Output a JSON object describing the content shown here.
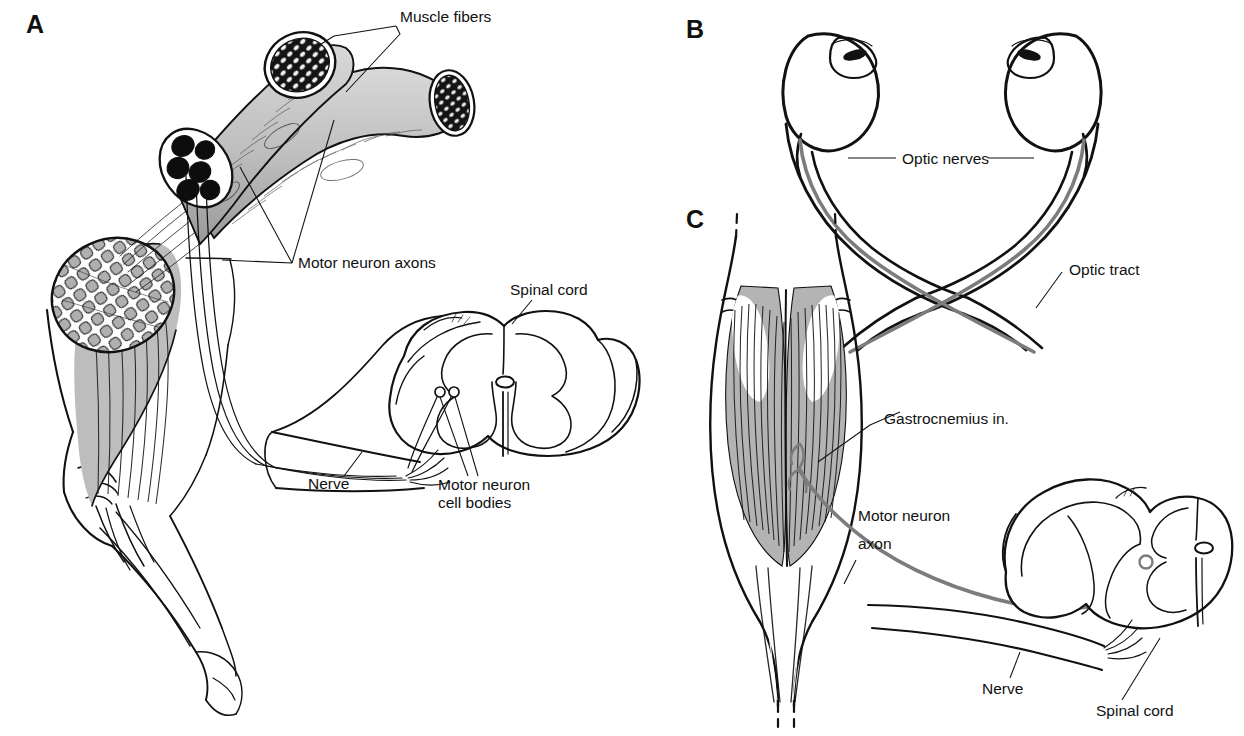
{
  "figure": {
    "background_color": "#ffffff",
    "ink_color": "#111111",
    "nerve_color": "#7c7c7c",
    "muscle_fill_color": "#b4b4b4"
  },
  "panels": [
    {
      "id": "A",
      "letter": "A",
      "subject": "Flexed human arm with biceps muscle, nerve bundle cross-sections, and spinal cord cross-section",
      "labels": [
        {
          "key": "muscle_fibers",
          "text": "Muscle fibers"
        },
        {
          "key": "motor_neuron_axons",
          "text": "Motor neuron axons"
        },
        {
          "key": "spinal_cord",
          "text": "Spinal cord"
        },
        {
          "key": "nerve",
          "text": "Nerve"
        },
        {
          "key": "motor_neuron_cell_bodies_line1",
          "text": "Motor neuron"
        },
        {
          "key": "motor_neuron_cell_bodies_line2",
          "text": "cell bodies"
        }
      ]
    },
    {
      "id": "B",
      "letter": "B",
      "subject": "Pair of eyeballs with optic nerves crossing at the optic chiasm into the optic tracts",
      "labels": [
        {
          "key": "optic_nerves",
          "text": "Optic nerves"
        },
        {
          "key": "optic_tract",
          "text": "Optic tract"
        }
      ]
    },
    {
      "id": "C",
      "letter": "C",
      "subject": "Gastrocnemius muscle with a single motor neuron axon running through a nerve to the spinal cord",
      "labels": [
        {
          "key": "gastrocnemius",
          "text": "Gastrocnemius in."
        },
        {
          "key": "motor_neuron_axon_line1",
          "text": "Motor neuron"
        },
        {
          "key": "motor_neuron_axon_line2",
          "text": "axon"
        },
        {
          "key": "nerve",
          "text": "Nerve"
        },
        {
          "key": "spinal_cord",
          "text": "Spinal cord"
        }
      ]
    }
  ],
  "panel_a": {
    "letter": "A",
    "muscle_fibers": "Muscle fibers",
    "motor_neuron_axons": "Motor neuron axons",
    "spinal_cord": "Spinal cord",
    "nerve": "Nerve",
    "cell_bodies_line1": "Motor neuron",
    "cell_bodies_line2": "cell bodies"
  },
  "panel_b": {
    "letter": "B",
    "optic_nerves": "Optic nerves",
    "optic_tract": "Optic tract"
  },
  "panel_c": {
    "letter": "C",
    "gastrocnemius": "Gastrocnemius in.",
    "motor_neuron_axon_line1": "Motor neuron",
    "motor_neuron_axon_line2": "axon",
    "nerve": "Nerve",
    "spinal_cord": "Spinal cord"
  }
}
